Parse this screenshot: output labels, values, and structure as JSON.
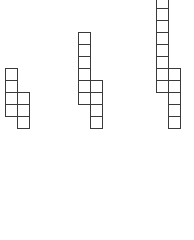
{
  "diagram": {
    "type": "tile-pattern",
    "cell_size": 12,
    "stroke_color": "#3a3a3a",
    "background": "#ffffff",
    "figures": [
      {
        "name": "figure-1",
        "columns": [
          {
            "x": 5,
            "top": 68,
            "cells": 4
          },
          {
            "x": 17,
            "top": 92,
            "cells": 3
          }
        ]
      },
      {
        "name": "figure-2",
        "columns": [
          {
            "x": 78,
            "top": 32,
            "cells": 6
          },
          {
            "x": 90,
            "top": 80,
            "cells": 4
          }
        ]
      },
      {
        "name": "figure-3",
        "columns": [
          {
            "x": 156,
            "top": -4,
            "cells": 8
          },
          {
            "x": 168,
            "top": 68,
            "cells": 5
          }
        ]
      }
    ]
  }
}
